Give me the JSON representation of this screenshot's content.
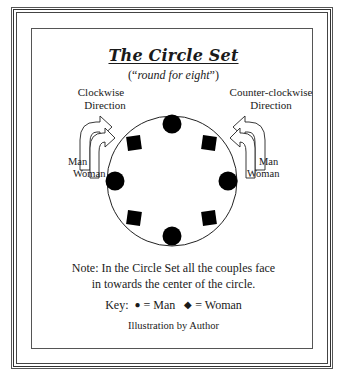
{
  "title": "The Circle Set",
  "subtitle": {
    "open": "(“",
    "text": "round for eight",
    "close": "”)"
  },
  "directions": {
    "left": {
      "line1": "Clockwise",
      "line2": "Direction",
      "man_label": "Man",
      "woman_label": "Woman"
    },
    "right": {
      "line1": "Counter-clockwise",
      "line2": "Direction",
      "man_label": "Man",
      "woman_label": "Woman"
    }
  },
  "circle": {
    "center": [
      172,
      181
    ],
    "radius": 65,
    "men": [
      {
        "position": "top",
        "x": 172,
        "y": 123
      },
      {
        "position": "left",
        "x": 114,
        "y": 181
      },
      {
        "position": "right",
        "x": 230,
        "y": 181
      },
      {
        "position": "bottom",
        "x": 172,
        "y": 237
      }
    ],
    "women": [
      {
        "position": "top-left",
        "x": 134,
        "y": 143
      },
      {
        "position": "top-right",
        "x": 209,
        "y": 143
      },
      {
        "position": "bottom-left",
        "x": 134,
        "y": 218
      },
      {
        "position": "bottom-right",
        "x": 209,
        "y": 218
      }
    ]
  },
  "note": {
    "line1": "Note: In the Circle Set all the couples face",
    "line2": "in towards the center of the circle."
  },
  "key": {
    "label": "Key:",
    "man_glyph": "●",
    "man_text": "= Man",
    "woman_glyph": "◆",
    "woman_text": "= Woman"
  },
  "credit": "Illustration by Author",
  "colors": {
    "ink": "#111111",
    "border": "#444444",
    "background": "#ffffff"
  }
}
